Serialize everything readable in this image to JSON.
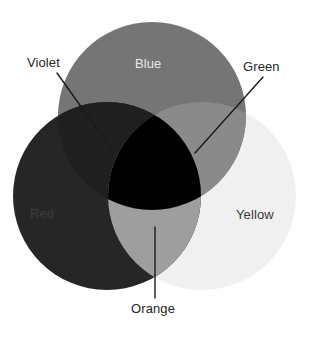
{
  "diagram": {
    "width": 309,
    "height": 338,
    "background_color": "#FFFFFF"
  },
  "chart_data": {
    "type": "venn",
    "title": "",
    "sets": [
      {
        "id": "blue",
        "label": "Blue",
        "color": "#757575",
        "cx": 152,
        "cy": 116,
        "r": 94,
        "label_color": "#E8E8E8",
        "label_position": "inside"
      },
      {
        "id": "red",
        "label": "Red",
        "color": "#262626",
        "cx": 107,
        "cy": 196,
        "r": 94,
        "label_color": "#3D3D3D",
        "label_position": "inside"
      },
      {
        "id": "yellow",
        "label": "Yellow",
        "color": "#F0F0F0",
        "cx": 202,
        "cy": 196,
        "r": 94,
        "label_color": "#3A3A3A",
        "label_position": "inside"
      }
    ],
    "intersections": [
      {
        "id": "violet",
        "label": "Violet",
        "members": [
          "blue",
          "red"
        ],
        "color": "#1F1F1F",
        "label_color": "#262626",
        "label_position": "outside"
      },
      {
        "id": "green",
        "label": "Green",
        "members": [
          "blue",
          "yellow"
        ],
        "color": "#8A8A8A",
        "label_color": "#262626",
        "label_position": "outside"
      },
      {
        "id": "orange",
        "label": "Orange",
        "members": [
          "red",
          "yellow"
        ],
        "color": "#9E9E9E",
        "label_color": "#262626",
        "label_position": "outside"
      },
      {
        "id": "center",
        "label": "",
        "members": [
          "blue",
          "red",
          "yellow"
        ],
        "color": "#000000",
        "label_color": "",
        "label_position": "none"
      }
    ],
    "leader_lines": [
      {
        "id": "violet-leader",
        "from": [
          57,
          73
        ],
        "to": [
          112,
          150
        ],
        "color": "#1A1A1A",
        "width": 1.4
      },
      {
        "id": "green-leader",
        "from": [
          263,
          77
        ],
        "to": [
          195,
          153
        ],
        "color": "#1A1A1A",
        "width": 1.4
      },
      {
        "id": "orange-leader",
        "from": [
          155,
          227
        ],
        "to": [
          155,
          298
        ],
        "color": "#1A1A1A",
        "width": 1.4
      }
    ],
    "legend": "none",
    "grid": false
  },
  "labels": {
    "violet": "Violet",
    "blue": "Blue",
    "green": "Green",
    "red": "Red",
    "yellow": "Yellow",
    "orange": "Orange"
  },
  "colors": {
    "blue_fill": "#757575",
    "red_fill": "#262626",
    "yellow_fill": "#F0F0F0",
    "violet_fill": "#1F1F1F",
    "green_fill": "#8A8A8A",
    "orange_fill": "#9E9E9E",
    "center_fill": "#000000",
    "leader_line": "#1A1A1A",
    "outer_text": "#262626",
    "blue_text": "#E8E8E8",
    "red_text": "#3D3D3D",
    "yellow_text": "#3A3A3A"
  }
}
